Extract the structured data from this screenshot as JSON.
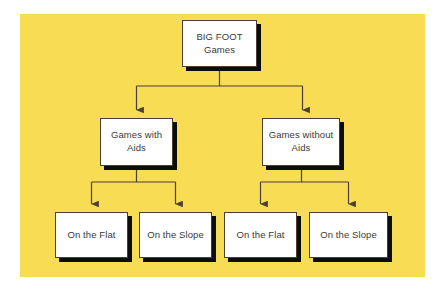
{
  "diagram": {
    "title": "BIG FOOT Games",
    "type": "hierarchy-tree",
    "panel_color": "#f7dc54",
    "box_fill": "#ffffff",
    "box_border_color": "#4a4033",
    "shadow_color": "#0c0c0c",
    "connector_color": "#4a4033",
    "text_color": "#3a3a3a",
    "levels": 3,
    "nodes": {
      "root": {
        "label": "BIG FOOT\nGames",
        "line1": "BIG FOOT",
        "line2": "Games",
        "level": 1
      },
      "with_aids": {
        "label": "Games with\nAids",
        "line1": "Games with",
        "line2": "Aids",
        "level": 2
      },
      "without_aids": {
        "label": "Games without\nAids",
        "line1": "Games without",
        "line2": "Aids",
        "level": 2
      },
      "flat_a": {
        "label": "On the Flat",
        "level": 3
      },
      "slope_a": {
        "label": "On the Slope",
        "level": 3
      },
      "flat_b": {
        "label": "On the Flat",
        "level": 3
      },
      "slope_b": {
        "label": "On the Slope",
        "level": 3
      }
    }
  }
}
